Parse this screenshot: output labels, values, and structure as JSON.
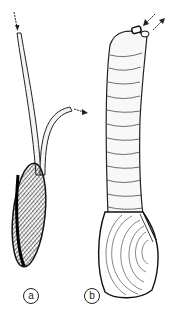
{
  "figure": {
    "panels": [
      {
        "id": "a",
        "label": "a",
        "subject": "bivalve with long separated siphons",
        "arrows": [
          "inhalant-in",
          "exhalant-out"
        ]
      },
      {
        "id": "b",
        "label": "b",
        "subject": "bivalve with fused wrinkled siphon",
        "arrows": [
          "inhalant-in",
          "exhalant-out"
        ]
      }
    ],
    "colors": {
      "ink": "#1a1a1a",
      "paper": "#ffffff"
    }
  }
}
